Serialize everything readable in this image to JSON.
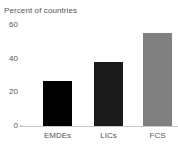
{
  "chart_data": {
    "type": "bar",
    "title": "Percent of countries",
    "subtitle": "",
    "xlabel": "",
    "ylabel": "",
    "categories": [
      "EMDEs",
      "LICs",
      "FCS"
    ],
    "values": [
      27,
      38,
      55
    ],
    "series": [
      {
        "name": "Percent of countries",
        "values": [
          27,
          38,
          55
        ]
      }
    ],
    "bar_colors": [
      "#000000",
      "#1a1a1a",
      "#808080"
    ],
    "ylim": [
      0,
      60
    ],
    "yticks": [
      0,
      20,
      40,
      60
    ],
    "ytick_labels": [
      "0",
      "20",
      "40",
      "60"
    ],
    "grid": false,
    "legend": false,
    "legend_position": "none"
  },
  "axes": {
    "y": {
      "ticks": [
        {
          "label": "60",
          "value": 60
        },
        {
          "label": "40",
          "value": 40
        },
        {
          "label": "20",
          "value": 20
        },
        {
          "label": "0",
          "value": 0
        }
      ]
    },
    "x": {
      "ticks": [
        {
          "label": "EMDEs"
        },
        {
          "label": "LICs"
        },
        {
          "label": "FCS"
        }
      ]
    }
  },
  "colors": {
    "background": "#ffffff",
    "text": "#555555",
    "axis_line": "#c8c8c8",
    "tick_mark": "#b3b3b3",
    "bar_emdes": "#000000",
    "bar_lics": "#1a1a1a",
    "bar_fcs": "#808080"
  }
}
